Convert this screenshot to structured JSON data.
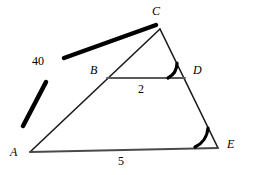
{
  "figure": {
    "background_color": "#ffffff",
    "width": 257,
    "height": 175
  },
  "colors": {
    "outline": "#1a1a1a",
    "segment_bd": "#5a5a5a",
    "base_ae": "#4a4a4a",
    "tick_mark": "#000000",
    "angle_arc": "#000000",
    "text": "#000000"
  },
  "vertices": [
    {
      "name": "A",
      "label": "A",
      "x": 30,
      "y": 152,
      "label_x": 10,
      "label_y": 146
    },
    {
      "name": "B",
      "label": "B",
      "x": 107,
      "y": 78,
      "label_x": 90,
      "label_y": 64
    },
    {
      "name": "C",
      "label": "C",
      "x": 160,
      "y": 29,
      "label_x": 152,
      "label_y": 5
    },
    {
      "name": "D",
      "label": "D",
      "x": 185,
      "y": 78,
      "label_x": 193,
      "label_y": 64
    },
    {
      "name": "E",
      "label": "E",
      "x": 218,
      "y": 148,
      "label_x": 227,
      "label_y": 138
    }
  ],
  "segments": [
    {
      "name": "side-AC",
      "from": "A",
      "to": "C",
      "x1": 30,
      "y1": 152,
      "x2": 160,
      "y2": 29,
      "color": "#1a1a1a",
      "width": 1.6
    },
    {
      "name": "side-CE",
      "from": "C",
      "to": "E",
      "x1": 160,
      "y1": 29,
      "x2": 218,
      "y2": 148,
      "color": "#1a1a1a",
      "width": 1.6
    },
    {
      "name": "base-AE",
      "from": "A",
      "to": "E",
      "x1": 30,
      "y1": 152,
      "x2": 218,
      "y2": 148,
      "color": "#4a4a4a",
      "width": 2.0
    },
    {
      "name": "segment-BD",
      "from": "B",
      "to": "D",
      "x1": 107,
      "y1": 78,
      "x2": 185,
      "y2": 78,
      "color": "#5a5a5a",
      "width": 2.0
    }
  ],
  "tick_marks": [
    {
      "name": "tick-lower",
      "x1": 23,
      "y1": 126,
      "x2": 46,
      "y2": 82,
      "width": 4.5
    },
    {
      "name": "tick-upper",
      "x1": 64,
      "y1": 58,
      "x2": 156,
      "y2": 25,
      "width": 4.5
    }
  ],
  "angle_marks": [
    {
      "name": "angle-at-D",
      "vertex": "D",
      "path": "M 168 78 A 17 17 0 0 0 177 63",
      "width": 3.2
    },
    {
      "name": "angle-at-E",
      "vertex": "E",
      "path": "M 195 147 A 23 23 0 0 0 208 128",
      "width": 3.2
    }
  ],
  "measure_labels": [
    {
      "name": "length-label-40",
      "text": "40",
      "x": 32,
      "y": 55,
      "describes": "segment marked by bold tick marks"
    },
    {
      "name": "length-label-2",
      "text": "2",
      "x": 138,
      "y": 83,
      "describes": "segment BD"
    },
    {
      "name": "length-label-5",
      "text": "5",
      "x": 118,
      "y": 155,
      "describes": "segment AE"
    }
  ]
}
